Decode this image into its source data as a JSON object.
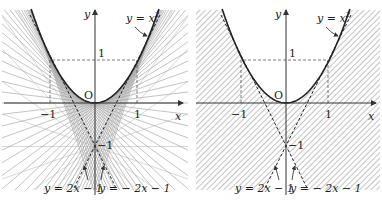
{
  "figure": {
    "panels": [
      {
        "id": "left",
        "description": "Parabola y = x^2 with family of lines through points, region covered by lines shaded with line rays",
        "curve_label": "y = x",
        "curve_exponent": "2",
        "axis_x_label": "x",
        "axis_y_label": "y",
        "origin_label": "O",
        "tick_x_neg": "−1",
        "tick_x_pos": "1",
        "tick_y_pos": "1",
        "tick_y_neg": "−1",
        "tangent_left_label": "y = 2x − 1",
        "tangent_right_label": "y = − 2x − 1",
        "style": "ray-lines"
      },
      {
        "id": "right",
        "description": "Parabola y = x^2 with shaded (hatched) region outside parabola and below tangent lines",
        "curve_label": "y = x",
        "curve_exponent": "2",
        "axis_x_label": "x",
        "axis_y_label": "y",
        "origin_label": "O",
        "tick_x_neg": "−1",
        "tick_x_pos": "1",
        "tick_y_pos": "1",
        "tick_y_neg": "−1",
        "tangent_left_label": "y = 2x − 1",
        "tangent_right_label": "y = − 2x − 1",
        "style": "hatched"
      }
    ],
    "colors": {
      "curve": "#222222",
      "axis": "#333333",
      "ray": "#9a9a9a",
      "hatch": "#8a8a8a",
      "dashed": "#444444",
      "text": "#222222"
    }
  }
}
